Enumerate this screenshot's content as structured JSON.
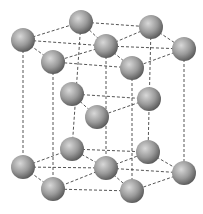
{
  "diagram": {
    "type": "hcp-crystal-lattice",
    "atom_radius": 12,
    "colors": {
      "atom_highlight": "#d8d8d8",
      "atom_mid": "#9a9a9a",
      "atom_shadow": "#555555",
      "bond": "#555555"
    },
    "atoms": [
      {
        "id": "t_l",
        "x": 23,
        "y": 40
      },
      {
        "id": "t_bl",
        "x": 81,
        "y": 22
      },
      {
        "id": "t_br",
        "x": 151,
        "y": 27
      },
      {
        "id": "t_r",
        "x": 184,
        "y": 49
      },
      {
        "id": "t_fr",
        "x": 132,
        "y": 68
      },
      {
        "id": "t_fl",
        "x": 53,
        "y": 62
      },
      {
        "id": "t_c",
        "x": 106,
        "y": 46
      },
      {
        "id": "m_1",
        "x": 72,
        "y": 94
      },
      {
        "id": "m_2",
        "x": 149,
        "y": 99
      },
      {
        "id": "m_3",
        "x": 97,
        "y": 117
      },
      {
        "id": "b_l",
        "x": 23,
        "y": 167
      },
      {
        "id": "b_bl",
        "x": 72,
        "y": 149
      },
      {
        "id": "b_br",
        "x": 148,
        "y": 152
      },
      {
        "id": "b_r",
        "x": 184,
        "y": 173
      },
      {
        "id": "b_fr",
        "x": 132,
        "y": 191
      },
      {
        "id": "b_fl",
        "x": 53,
        "y": 189
      },
      {
        "id": "b_c",
        "x": 106,
        "y": 168
      }
    ],
    "bonds": [
      [
        "t_l",
        "t_bl"
      ],
      [
        "t_bl",
        "t_br"
      ],
      [
        "t_br",
        "t_r"
      ],
      [
        "t_r",
        "t_fr"
      ],
      [
        "t_fr",
        "t_fl"
      ],
      [
        "t_fl",
        "t_l"
      ],
      [
        "t_c",
        "t_l"
      ],
      [
        "t_c",
        "t_bl"
      ],
      [
        "t_c",
        "t_br"
      ],
      [
        "t_c",
        "t_r"
      ],
      [
        "t_c",
        "t_fr"
      ],
      [
        "t_c",
        "t_fl"
      ],
      [
        "m_1",
        "m_2"
      ],
      [
        "m_2",
        "m_3"
      ],
      [
        "m_3",
        "m_1"
      ],
      [
        "b_l",
        "b_bl"
      ],
      [
        "b_bl",
        "b_br"
      ],
      [
        "b_br",
        "b_r"
      ],
      [
        "b_r",
        "b_fr"
      ],
      [
        "b_fr",
        "b_fl"
      ],
      [
        "b_fl",
        "b_l"
      ],
      [
        "b_c",
        "b_l"
      ],
      [
        "b_c",
        "b_bl"
      ],
      [
        "b_c",
        "b_br"
      ],
      [
        "b_c",
        "b_r"
      ],
      [
        "b_c",
        "b_fr"
      ],
      [
        "b_c",
        "b_fl"
      ],
      [
        "t_l",
        "b_l"
      ],
      [
        "t_bl",
        "b_bl"
      ],
      [
        "t_br",
        "b_br"
      ],
      [
        "t_r",
        "b_r"
      ],
      [
        "t_fr",
        "b_fr"
      ],
      [
        "t_fl",
        "b_fl"
      ],
      [
        "t_c",
        "b_c"
      ]
    ]
  }
}
